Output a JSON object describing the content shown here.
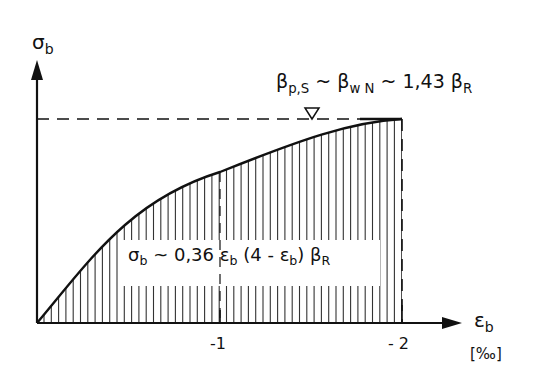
{
  "y_axis": {
    "symbol": "σ",
    "subscript": "b"
  },
  "x_axis": {
    "symbol": "ε",
    "subscript": "b",
    "unit": "[‰]",
    "ticks": [
      "-1",
      "- 2"
    ]
  },
  "peak_label": {
    "beta1": "β",
    "sub1": "p,S",
    "sep1": " ~ ",
    "beta2": "β",
    "sub2": "w N",
    "sep2": " ~ 1,43 ",
    "beta3": "β",
    "sub3": "R"
  },
  "formula": {
    "sigma": "σ",
    "sigma_sub": "b",
    "part1": " ~ 0,36 ",
    "eps1": "ε",
    "eps1_sub": "b",
    "part2": " (4 - ",
    "eps2": "ε",
    "eps2_sub": "b",
    "part3": ") ",
    "beta": "β",
    "beta_sub": "R"
  },
  "chart_data": {
    "type": "area",
    "title": "",
    "xlabel": "ε_b [‰]",
    "ylabel": "σ_b",
    "x": [
      0,
      -0.25,
      -0.5,
      -0.75,
      -1.0,
      -1.25,
      -1.5,
      -1.75,
      -2.0
    ],
    "values": [
      0,
      0.84,
      1.58,
      2.23,
      2.78,
      3.24,
      3.59,
      3.85,
      4.0
    ],
    "normalized_to_peak": [
      0,
      0.21,
      0.39,
      0.56,
      0.7,
      0.81,
      0.9,
      0.96,
      1.0
    ],
    "formula": "σ_b ~ 0,36 ε_b (4 - ε_b) β_R",
    "annotations": [
      "β_p,S ~ β_wN ~ 1,43 β_R",
      "∇ marker at peak level"
    ],
    "x_ticks": [
      "-1",
      "-2"
    ],
    "xlim": [
      0,
      -2.3
    ],
    "hatching": "vertical lines under curve",
    "grid": false
  }
}
